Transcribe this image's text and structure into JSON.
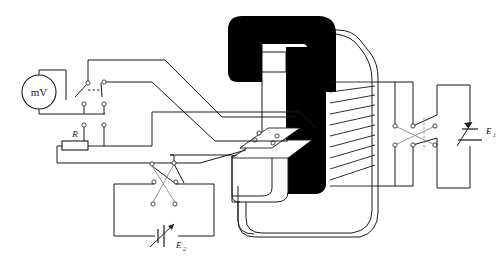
{
  "figure": {
    "type": "schematic-diagram",
    "width": 500,
    "height": 269,
    "background_color": "#ffffff",
    "line_color": "#1a1a1a",
    "core_fill": "#000000",
    "terminal_fill": "#ffffff"
  },
  "labels": {
    "meter": "mV",
    "resistor": "R",
    "battery_right_base": "E",
    "battery_right_sub": "1",
    "battery_bottom_base": "E",
    "battery_bottom_sub": "2"
  },
  "components": {
    "meter": {
      "name": "millivoltmeter",
      "text": "mV",
      "shape": "circle",
      "cx": 39,
      "cy": 92,
      "r": 17
    },
    "resistor": {
      "name": "resistor-R",
      "label": "R",
      "x": 62,
      "y": 141,
      "w": 26,
      "h": 9
    },
    "magnet_core": {
      "name": "electromagnet-c-core",
      "fill": "#000000",
      "description": "C-shaped laminated magnet yoke with pole pieces"
    },
    "coil": {
      "name": "magnet-coil-winding",
      "turns": 9,
      "description": "diagonal hatch winding on right limb"
    },
    "sample": {
      "name": "hall-sample-plate",
      "contacts": 4,
      "description": "thin plate in magnet gap with four probe terminals"
    },
    "switch_meter": {
      "name": "dpdt-meter-switch",
      "poles": 2,
      "ganged": true
    },
    "switch_e2": {
      "name": "reversing-switch-e2",
      "terminals": 6
    },
    "switch_e1": {
      "name": "reversing-switch-e1",
      "terminals": 6
    },
    "battery_e1": {
      "name": "variable-battery-e1",
      "label": "E1",
      "variable": true,
      "orientation": "vertical"
    },
    "battery_e2": {
      "name": "variable-battery-e2",
      "label": "E2",
      "variable": true,
      "orientation": "horizontal"
    }
  },
  "terminal_style": {
    "radius": 2.1,
    "stroke": "#333333",
    "fill": "#ffffff"
  }
}
